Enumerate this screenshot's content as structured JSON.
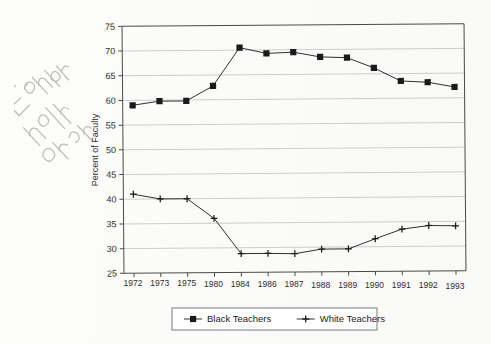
{
  "chart_data": {
    "type": "line",
    "title": "",
    "xlabel": "",
    "ylabel": "Percent of Faculty",
    "categories": [
      "1972",
      "1973",
      "1975",
      "1980",
      "1984",
      "1986",
      "1987",
      "1988",
      "1989",
      "1990",
      "1991",
      "1992",
      "1993"
    ],
    "ylim": [
      25,
      75
    ],
    "yticks": [
      25,
      30,
      35,
      40,
      45,
      50,
      55,
      60,
      65,
      70,
      75
    ],
    "grid": true,
    "legend_position": "bottom-center",
    "series": [
      {
        "name": "Black Teachers",
        "marker": "filled-square",
        "color": "#1a1a1a",
        "values": [
          59.0,
          59.8,
          59.8,
          62.8,
          70.5,
          69.3,
          69.5,
          68.5,
          68.3,
          66.2,
          63.5,
          63.2,
          62.2
        ]
      },
      {
        "name": "White Teachers",
        "marker": "plus",
        "color": "#1a1a1a",
        "values": [
          41.0,
          40.0,
          40.0,
          36.0,
          28.8,
          28.8,
          28.7,
          29.6,
          29.6,
          31.6,
          33.5,
          34.2,
          34.1
        ]
      }
    ]
  },
  "legend": {
    "entries": [
      {
        "label": "Black Teachers",
        "marker": "filled-square"
      },
      {
        "label": "White Teachers",
        "marker": "plus"
      }
    ]
  },
  "annotation": {
    "kind": "handwritten-pencil-note",
    "text": "Explain"
  },
  "axes": {
    "y_title": "Percent of Faculty",
    "y_tick_labels": [
      "75",
      "70",
      "65",
      "60",
      "55",
      "50",
      "45",
      "40",
      "35",
      "30",
      "25"
    ],
    "x_tick_labels": [
      "1972",
      "1973",
      "1975",
      "1980",
      "1984",
      "1986",
      "1987",
      "1988",
      "1989",
      "1990",
      "1991",
      "1992",
      "1993"
    ]
  },
  "colors": {
    "ink": "#1a1a1a",
    "grid": "#b9b9b9",
    "axis": "#4a4a4a",
    "paper": "#fefefe"
  }
}
